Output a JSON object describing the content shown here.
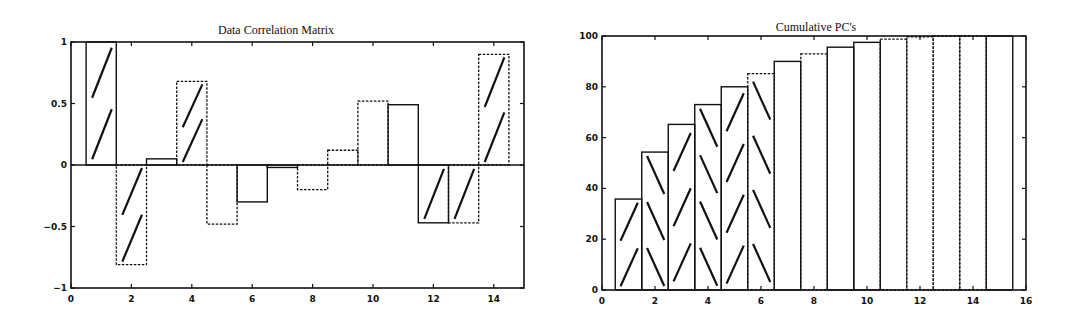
{
  "chart_data": [
    {
      "id": "left",
      "type": "bar",
      "title": "Data Correlation Matrix",
      "xlabel": "",
      "ylabel": "",
      "x": [
        1,
        2,
        3,
        4,
        5,
        6,
        7,
        8,
        9,
        10,
        11,
        12,
        13,
        14
      ],
      "values": [
        1.0,
        -0.81,
        0.05,
        0.68,
        -0.48,
        -0.3,
        -0.02,
        -0.2,
        0.12,
        0.52,
        0.49,
        -0.47,
        -0.47,
        0.9
      ],
      "hatched": [
        false,
        true,
        true,
        false,
        true,
        false,
        false,
        false,
        false,
        false,
        false,
        true,
        true,
        true
      ],
      "hatched_bars_note": "bars 2,3 (x=1,2 region) etc. rendered with sparse '/' strokes",
      "hatch_indices": [
        1,
        2,
        4,
        12,
        13,
        14
      ],
      "dashed": [
        false,
        true,
        false,
        true,
        true,
        false,
        false,
        true,
        true,
        true,
        false,
        false,
        true,
        true
      ],
      "xlim": [
        0,
        15
      ],
      "ylim": [
        -1,
        1
      ],
      "xticks": [
        0,
        2,
        4,
        6,
        8,
        10,
        12,
        14
      ],
      "yticks": [
        -1,
        -0.5,
        0,
        0.5,
        1
      ],
      "ytick_labels": [
        "-1",
        "-0.5",
        "0",
        "0.5",
        "1"
      ],
      "zero_line": true,
      "grid": false,
      "legend": null
    },
    {
      "id": "right",
      "type": "bar",
      "title": "Cumulative PC's",
      "xlabel": "",
      "ylabel": "",
      "x": [
        1,
        2,
        3,
        4,
        5,
        6,
        7,
        8,
        9,
        10,
        11,
        12,
        13,
        14,
        15
      ],
      "values": [
        35.8,
        54.3,
        65.2,
        73.0,
        80.0,
        85.2,
        90.0,
        93.0,
        95.6,
        97.5,
        98.8,
        99.7,
        100,
        100,
        100
      ],
      "hatch": [
        "slash",
        "backslash",
        "slash",
        "backslash",
        "slash",
        "backslash",
        "none",
        "none",
        "none",
        "none",
        "none",
        "none",
        "none",
        "none",
        "none"
      ],
      "dashed": [
        false,
        false,
        false,
        false,
        false,
        true,
        false,
        true,
        false,
        false,
        true,
        true,
        true,
        true,
        false
      ],
      "xlim": [
        0,
        16
      ],
      "ylim": [
        0,
        100
      ],
      "xticks": [
        0,
        2,
        4,
        6,
        8,
        10,
        12,
        14,
        16
      ],
      "yticks": [
        0,
        20,
        40,
        60,
        80,
        100
      ],
      "grid": false,
      "legend": null
    }
  ]
}
